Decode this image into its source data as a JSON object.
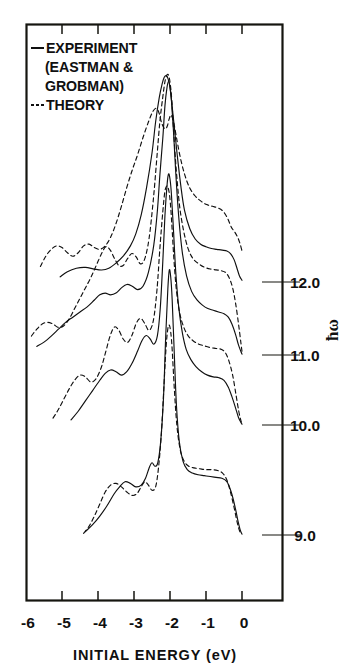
{
  "figure": {
    "xaxis": {
      "title": "INITIAL ENERGY (eV)",
      "ticks": [
        "-6",
        "-5",
        "-4",
        "-3",
        "-2",
        "-1",
        "0"
      ],
      "range": [
        -6,
        0
      ]
    },
    "yaxis": {
      "title": "ħω",
      "labels": [
        "12.0",
        "11.0",
        "10.0",
        "9.0"
      ],
      "unit": "eV"
    },
    "legend": {
      "items": [
        {
          "marker": "solid-line",
          "label": "EXPERIMENT"
        },
        {
          "marker": "none",
          "label": "(EASTMAN &"
        },
        {
          "marker": "none",
          "label": "GROBMAN)"
        },
        {
          "marker": "dashed-line",
          "label": "THEORY"
        }
      ]
    }
  },
  "chart_data": {
    "type": "line",
    "title": "",
    "xlabel": "INITIAL ENERGY (eV)",
    "ylabel": "ħω",
    "xlim": [
      -6,
      0
    ],
    "grid": false,
    "legend_position": "top-left",
    "offsets": {
      "12.0": 282,
      "11.0": 355,
      "10.0": 425,
      "9.0": 535
    },
    "series": [
      {
        "name": "EXPERIMENT",
        "style": "solid",
        "curves": [
          {
            "photon_energy": "12.0",
            "x": [
              -5.05,
              -4.85,
              -4.6,
              -4.35,
              -4.1,
              -3.9,
              -3.7,
              -3.5,
              -3.3,
              -3.1,
              -2.95,
              -2.8,
              -2.65,
              -2.5,
              -2.4,
              -2.3,
              -2.22,
              -2.16,
              -2.1,
              -2.05,
              -2.0,
              -1.95,
              -1.88,
              -1.8,
              -1.7,
              -1.6,
              -1.45,
              -1.3,
              -1.15,
              -1.0,
              -0.85,
              -0.7,
              -0.55,
              -0.42,
              -0.32,
              -0.22,
              -0.14,
              -0.07,
              0.0
            ],
            "y": [
              6,
              12,
              16,
              17,
              15,
              14,
              16,
              22,
              30,
              42,
              56,
              78,
              110,
              150,
              186,
              214,
              230,
              238,
              240,
              236,
              226,
              208,
              180,
              148,
              112,
              84,
              62,
              50,
              44,
              41,
              39,
              38,
              37,
              36,
              33,
              26,
              16,
              7,
              2
            ]
          },
          {
            "photon_energy": "11.0",
            "x": [
              -5.7,
              -5.5,
              -5.3,
              -5.1,
              -4.9,
              -4.7,
              -4.5,
              -4.3,
              -4.1,
              -3.95,
              -3.8,
              -3.65,
              -3.5,
              -3.35,
              -3.2,
              -3.05,
              -2.9,
              -2.75,
              -2.6,
              -2.45,
              -2.35,
              -2.28,
              -2.2,
              -2.14,
              -2.08,
              -2.04,
              -2.0,
              -1.96,
              -1.9,
              -1.84,
              -1.76,
              -1.66,
              -1.54,
              -1.4,
              -1.25,
              -1.1,
              -0.95,
              -0.8,
              -0.65,
              -0.5,
              -0.38,
              -0.28,
              -0.18,
              -0.1,
              -0.03,
              0.0
            ],
            "y": [
              10,
              15,
              22,
              30,
              38,
              44,
              50,
              56,
              64,
              70,
              72,
              70,
              72,
              78,
              82,
              80,
              76,
              80,
              96,
              128,
              168,
              210,
              252,
              290,
              312,
              318,
              312,
              296,
              258,
              212,
              162,
              120,
              92,
              74,
              64,
              58,
              54,
              52,
              50,
              48,
              44,
              36,
              24,
              12,
              4,
              1
            ]
          },
          {
            "photon_energy": "10.0",
            "x": [
              -4.75,
              -4.55,
              -4.35,
              -4.15,
              -3.95,
              -3.8,
              -3.65,
              -3.5,
              -3.35,
              -3.2,
              -3.05,
              -2.9,
              -2.78,
              -2.66,
              -2.55,
              -2.45,
              -2.35,
              -2.27,
              -2.2,
              -2.14,
              -2.08,
              -2.04,
              -2.0,
              -1.96,
              -1.9,
              -1.84,
              -1.76,
              -1.66,
              -1.55,
              -1.42,
              -1.28,
              -1.12,
              -0.96,
              -0.8,
              -0.64,
              -0.5,
              -0.38,
              -0.28,
              -0.18,
              -0.1,
              -0.03,
              0.0
            ],
            "y": [
              6,
              16,
              28,
              40,
              52,
              60,
              64,
              62,
              58,
              62,
              72,
              86,
              98,
              104,
              100,
              94,
              104,
              136,
              190,
              244,
              280,
              292,
              286,
              268,
              224,
              178,
              138,
              108,
              88,
              76,
              68,
              62,
              58,
              56,
              55,
              52,
              44,
              33,
              20,
              9,
              3,
              1
            ]
          },
          {
            "photon_energy": "9.0",
            "x": [
              -4.35,
              -4.15,
              -3.95,
              -3.75,
              -3.55,
              -3.4,
              -3.25,
              -3.1,
              -2.95,
              -2.8,
              -2.68,
              -2.58,
              -2.5,
              -2.42,
              -2.34,
              -2.26,
              -2.18,
              -2.12,
              -2.06,
              -2.02,
              -1.98,
              -1.94,
              -1.88,
              -1.82,
              -1.74,
              -1.64,
              -1.52,
              -1.38,
              -1.22,
              -1.05,
              -0.88,
              -0.72,
              -0.56,
              -0.42,
              -0.3,
              -0.2,
              -0.12,
              -0.05,
              0.0
            ],
            "y": [
              4,
              12,
              22,
              34,
              48,
              56,
              62,
              60,
              56,
              58,
              66,
              78,
              84,
              80,
              84,
              108,
              160,
              230,
              286,
              308,
              300,
              274,
              210,
              150,
              108,
              86,
              76,
              72,
              70,
              69,
              68,
              67,
              66,
              62,
              50,
              34,
              18,
              6,
              1
            ]
          }
        ]
      },
      {
        "name": "THEORY",
        "style": "dashed",
        "curves": [
          {
            "photon_energy": "12.0",
            "x": [
              -5.6,
              -5.45,
              -5.3,
              -5.15,
              -5.0,
              -4.85,
              -4.7,
              -4.55,
              -4.4,
              -4.25,
              -4.1,
              -3.95,
              -3.8,
              -3.65,
              -3.5,
              -3.35,
              -3.2,
              -3.05,
              -2.9,
              -2.75,
              -2.6,
              -2.48,
              -2.38,
              -2.3,
              -2.24,
              -2.18,
              -2.12,
              -2.07,
              -2.02,
              -1.97,
              -1.9,
              -1.82,
              -1.72,
              -1.6,
              -1.46,
              -1.3,
              -1.14,
              -0.98,
              -0.82,
              -0.66,
              -0.52,
              -0.4,
              -0.3,
              -0.2,
              -0.12,
              -0.05,
              0.0
            ],
            "y": [
              18,
              30,
              38,
              42,
              40,
              34,
              30,
              34,
              42,
              44,
              40,
              38,
              42,
              52,
              68,
              88,
              110,
              130,
              148,
              168,
              186,
              198,
              202,
              196,
              186,
              180,
              178,
              182,
              190,
              194,
              186,
              168,
              146,
              126,
              110,
              100,
              94,
              90,
              88,
              86,
              82,
              74,
              64,
              58,
              52,
              44,
              36
            ]
          },
          {
            "photon_energy": "11.0",
            "x": [
              -5.85,
              -5.7,
              -5.55,
              -5.4,
              -5.25,
              -5.1,
              -4.95,
              -4.8,
              -4.65,
              -4.5,
              -4.35,
              -4.2,
              -4.05,
              -3.9,
              -3.78,
              -3.66,
              -3.54,
              -3.42,
              -3.3,
              -3.18,
              -3.06,
              -2.94,
              -2.82,
              -2.7,
              -2.58,
              -2.46,
              -2.36,
              -2.28,
              -2.2,
              -2.14,
              -2.08,
              -2.03,
              -1.99,
              -1.95,
              -1.89,
              -1.82,
              -1.73,
              -1.62,
              -1.5,
              -1.36,
              -1.2,
              -1.04,
              -0.88,
              -0.72,
              -0.58,
              -0.46,
              -0.36,
              -0.26,
              -0.17,
              -0.09,
              -0.03,
              0.0
            ],
            "y": [
              22,
              30,
              36,
              38,
              36,
              32,
              34,
              42,
              54,
              66,
              78,
              90,
              104,
              118,
              126,
              122,
              112,
              104,
              104,
              112,
              118,
              114,
              106,
              112,
              136,
              182,
              232,
              272,
              300,
              318,
              326,
              324,
              314,
              296,
              254,
              212,
              172,
              144,
              124,
              112,
              106,
              102,
              100,
              99,
              98,
              96,
              90,
              78,
              58,
              34,
              14,
              4
            ]
          },
          {
            "photon_energy": "10.0",
            "x": [
              -5.25,
              -5.1,
              -4.95,
              -4.8,
              -4.65,
              -4.5,
              -4.35,
              -4.2,
              -4.05,
              -3.9,
              -3.78,
              -3.66,
              -3.54,
              -3.42,
              -3.3,
              -3.18,
              -3.06,
              -2.94,
              -2.82,
              -2.7,
              -2.58,
              -2.46,
              -2.36,
              -2.28,
              -2.2,
              -2.14,
              -2.08,
              -2.03,
              -1.99,
              -1.95,
              -1.89,
              -1.82,
              -1.73,
              -1.62,
              -1.5,
              -1.36,
              -1.2,
              -1.04,
              -0.88,
              -0.72,
              -0.58,
              -0.46,
              -0.36,
              -0.26,
              -0.17,
              -0.09,
              -0.03,
              0.0
            ],
            "y": [
              8,
              18,
              30,
              42,
              52,
              58,
              56,
              50,
              54,
              68,
              86,
              104,
              114,
              110,
              100,
              96,
              104,
              118,
              124,
              118,
              110,
              122,
              158,
              206,
              248,
              272,
              278,
              272,
              258,
              234,
              192,
              156,
              130,
              114,
              104,
              98,
              94,
              92,
              90,
              89,
              88,
              84,
              74,
              58,
              36,
              16,
              5,
              1
            ]
          },
          {
            "photon_energy": "9.0",
            "x": [
              -4.4,
              -4.25,
              -4.1,
              -3.95,
              -3.8,
              -3.65,
              -3.5,
              -3.35,
              -3.2,
              -3.05,
              -2.92,
              -2.8,
              -2.7,
              -2.6,
              -2.5,
              -2.4,
              -2.32,
              -2.24,
              -2.17,
              -2.11,
              -2.06,
              -2.02,
              -1.98,
              -1.94,
              -1.88,
              -1.81,
              -1.72,
              -1.61,
              -1.48,
              -1.33,
              -1.17,
              -1.0,
              -0.84,
              -0.68,
              -0.54,
              -0.42,
              -0.32,
              -0.22,
              -0.13,
              -0.06,
              0.0
            ],
            "y": [
              2,
              10,
              22,
              36,
              50,
              58,
              60,
              56,
              50,
              46,
              48,
              56,
              62,
              58,
              52,
              56,
              78,
              118,
              172,
              218,
              240,
              244,
              236,
              216,
              170,
              128,
              100,
              86,
              80,
              78,
              77,
              76,
              76,
              75,
              72,
              64,
              50,
              32,
              14,
              4,
              1
            ]
          }
        ]
      }
    ]
  }
}
